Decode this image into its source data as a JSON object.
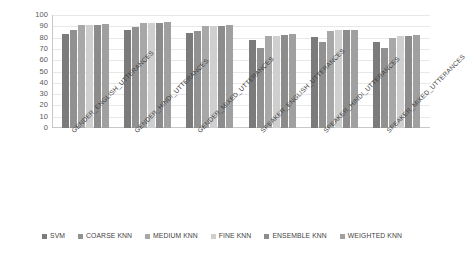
{
  "chart_data": {
    "type": "bar",
    "title": "",
    "xlabel": "",
    "ylabel": "",
    "ylim": [
      0,
      100
    ],
    "yticks": [
      0,
      10,
      20,
      30,
      40,
      50,
      60,
      70,
      80,
      90,
      100
    ],
    "grid": true,
    "legend_position": "bottom",
    "categories": [
      "GENDER_ENGLISH_UTTERANCES",
      "GENDER_HINDI_UTTERANCES",
      "GENDER_MIXED_UTTERANCES",
      "SPEAKER_ENGLISH_UTTERANCES",
      "SPEAKER_HINDI_UTTERANCES",
      "SPEAKER_MIXED_UTTERANCES"
    ],
    "series": [
      {
        "name": "SVM",
        "color": "#7b7b7b",
        "values": [
          83,
          87,
          84,
          78,
          80.5,
          76
        ]
      },
      {
        "name": "COARSE KNN",
        "color": "#919191",
        "values": [
          86.5,
          89.5,
          86,
          71,
          76,
          71
        ]
      },
      {
        "name": "MEDIUM KNN",
        "color": "#a8a8a8",
        "values": [
          91,
          92.5,
          90.5,
          81,
          85.5,
          80
        ]
      },
      {
        "name": "FINE KNN",
        "color": "#cfcfcf",
        "values": [
          91,
          93,
          90,
          81.5,
          87,
          81
        ]
      },
      {
        "name": "ENSEMBLE KNN",
        "color": "#8c8c8c",
        "values": [
          91,
          92.5,
          90,
          82,
          87,
          81
        ]
      },
      {
        "name": "WEIGHTED KNN",
        "color": "#a0a0a0",
        "values": [
          92,
          93.5,
          91.5,
          83,
          87,
          82.5
        ]
      }
    ]
  },
  "axis": {
    "y_tick_labels": [
      "100",
      "90",
      "80",
      "70",
      "60",
      "50",
      "40",
      "30",
      "20",
      "10",
      "0"
    ]
  }
}
